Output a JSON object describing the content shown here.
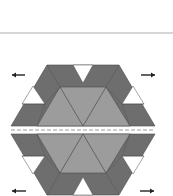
{
  "diagram": {
    "colors": {
      "background": "#ffffff",
      "rule": "#c8c8c8",
      "dark": "#6e6e6e",
      "light": "#9c9c9c",
      "white": "#ffffff",
      "outline": "#4a4a4a",
      "seam": "#9a9a9a",
      "arrow": "#222222"
    },
    "top_rule": {
      "x1": 0,
      "x2": 173,
      "y": 33
    },
    "seam": {
      "x1": 11,
      "x2": 155,
      "y": 130,
      "dash": "4 2"
    },
    "halves": [
      {
        "name": "upper-half",
        "outer": [
          [
            47,
            65
          ],
          [
            119,
            65
          ],
          [
            155,
            126
          ],
          [
            11,
            126
          ]
        ],
        "center_trapezoid": [
          [
            60,
            87
          ],
          [
            106,
            87
          ],
          [
            130,
            126
          ],
          [
            37,
            126
          ]
        ],
        "triangle_lines": [
          [
            [
              60,
              87
            ],
            [
              83,
              126
            ]
          ],
          [
            [
              83,
              126
            ],
            [
              106,
              87
            ]
          ]
        ],
        "white_triangles": [
          [
            [
              73,
              65
            ],
            [
              93,
              65
            ],
            [
              83,
              83
            ]
          ],
          [
            [
              33,
              86
            ],
            [
              22,
              104
            ],
            [
              45,
              104
            ]
          ],
          [
            [
              133,
              86
            ],
            [
              122,
              104
            ],
            [
              144,
              104
            ]
          ]
        ],
        "dark_divider_lines": [
          [
            [
              60,
              87
            ],
            [
              47,
              65
            ]
          ],
          [
            [
              106,
              87
            ],
            [
              119,
              65
            ]
          ],
          [
            [
              22,
              104
            ],
            [
              45,
              104
            ]
          ],
          [
            [
              122,
              104
            ],
            [
              144,
              104
            ]
          ],
          [
            [
              45,
              104
            ],
            [
              37,
              126
            ]
          ],
          [
            [
              122,
              104
            ],
            [
              130,
              126
            ]
          ],
          [
            [
              60,
              87
            ],
            [
              45,
              104
            ]
          ],
          [
            [
              106,
              87
            ],
            [
              122,
              104
            ]
          ]
        ]
      },
      {
        "name": "lower-half",
        "outer": [
          [
            11,
            134
          ],
          [
            155,
            134
          ],
          [
            119,
            195
          ],
          [
            47,
            195
          ]
        ],
        "center_trapezoid": [
          [
            37,
            134
          ],
          [
            130,
            134
          ],
          [
            106,
            173
          ],
          [
            60,
            173
          ]
        ],
        "triangle_lines": [
          [
            [
              60,
              173
            ],
            [
              83,
              134
            ]
          ],
          [
            [
              83,
              134
            ],
            [
              106,
              173
            ]
          ]
        ],
        "white_triangles": [
          [
            [
              73,
              195
            ],
            [
              93,
              195
            ],
            [
              83,
              177
            ]
          ],
          [
            [
              33,
              174
            ],
            [
              22,
              156
            ],
            [
              45,
              156
            ]
          ],
          [
            [
              133,
              174
            ],
            [
              122,
              156
            ],
            [
              144,
              156
            ]
          ]
        ],
        "dark_divider_lines": [
          [
            [
              60,
              173
            ],
            [
              47,
              195
            ]
          ],
          [
            [
              106,
              173
            ],
            [
              119,
              195
            ]
          ],
          [
            [
              22,
              156
            ],
            [
              45,
              156
            ]
          ],
          [
            [
              122,
              156
            ],
            [
              144,
              156
            ]
          ],
          [
            [
              45,
              156
            ],
            [
              37,
              134
            ]
          ],
          [
            [
              122,
              156
            ],
            [
              130,
              134
            ]
          ],
          [
            [
              60,
              173
            ],
            [
              45,
              156
            ]
          ],
          [
            [
              106,
              173
            ],
            [
              122,
              156
            ]
          ]
        ]
      }
    ],
    "arrows": [
      {
        "name": "arrow-top-left",
        "direction": "left",
        "x1": 12,
        "x2": 25,
        "y": 75
      },
      {
        "name": "arrow-top-right",
        "direction": "right",
        "x1": 141,
        "x2": 155,
        "y": 75
      },
      {
        "name": "arrow-bottom-left",
        "direction": "left",
        "x1": 12,
        "x2": 26,
        "y": 191
      },
      {
        "name": "arrow-bottom-right",
        "direction": "right",
        "x1": 140,
        "x2": 154,
        "y": 191
      }
    ]
  }
}
